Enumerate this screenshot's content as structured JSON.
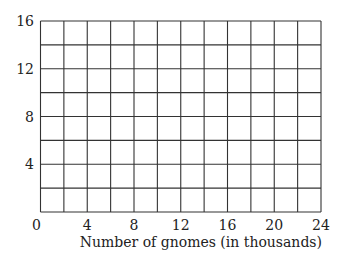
{
  "chart_data": {
    "type": "line",
    "title": "",
    "xlabel": "Number of gnomes (in thousands)",
    "ylabel": "",
    "xlim": [
      0,
      24
    ],
    "ylim": [
      0,
      16
    ],
    "x_ticks": [
      "0",
      "4",
      "8",
      "12",
      "16",
      "20",
      "24"
    ],
    "y_ticks": [
      "4",
      "8",
      "12",
      "16"
    ],
    "grid": true,
    "grid_x_step": 2,
    "grid_y_step": 2,
    "series": []
  },
  "colors": {
    "grid": "#333333",
    "text": "#222222"
  }
}
